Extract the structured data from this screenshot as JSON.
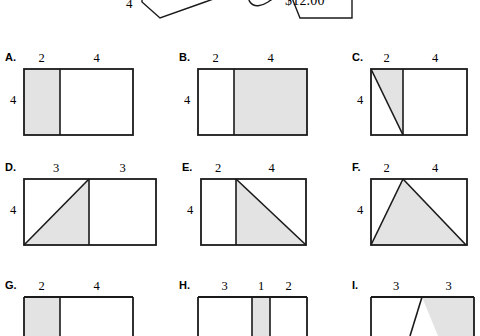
{
  "page": {
    "background_color": "#ffffff",
    "stroke_color": "#1a1a1a",
    "shade_color": "#e3e3e3",
    "width": 480,
    "height": 312
  },
  "top_partial": {
    "price_label": "$12.00",
    "side_label": "4",
    "note": "partially cropped shapes at top edge"
  },
  "items": [
    {
      "key": "A",
      "label": "A.",
      "top_labels": [
        "2",
        "4"
      ],
      "left_label": "4",
      "shaded_region": "left-rectangle",
      "split_fraction": 0.3333
    },
    {
      "key": "B",
      "label": "B.",
      "top_labels": [
        "2",
        "4"
      ],
      "left_label": "4",
      "shaded_region": "right-rectangle",
      "split_fraction": 0.3333
    },
    {
      "key": "C",
      "label": "C.",
      "top_labels": [
        "2",
        "4"
      ],
      "left_label": "4",
      "shaded_region": "left-triangle-upper-right",
      "split_fraction": 0.3333
    },
    {
      "key": "D",
      "label": "D.",
      "top_labels": [
        "3",
        "3"
      ],
      "left_label": "4",
      "shaded_region": "left-triangle-lower-right",
      "split_fraction": 0.5
    },
    {
      "key": "E",
      "label": "E.",
      "top_labels": [
        "2",
        "4"
      ],
      "left_label": "4",
      "shaded_region": "right-triangle-lower-left",
      "split_fraction": 0.3333
    },
    {
      "key": "F",
      "label": "F.",
      "top_labels": [
        "2",
        "4"
      ],
      "left_label": "4",
      "shaded_region": "full-width-triangle-apex-at-split",
      "split_fraction": 0.3333
    },
    {
      "key": "G",
      "label": "G.",
      "top_labels": [
        "2",
        "4"
      ],
      "left_label": "",
      "shaded_region": "cropped",
      "split_fraction": 0.3333
    },
    {
      "key": "H",
      "label": "H.",
      "top_labels": [
        "3",
        "1",
        "2"
      ],
      "left_label": "",
      "shaded_region": "cropped",
      "split_fraction": 0.5
    },
    {
      "key": "I",
      "label": "I.",
      "top_labels": [
        "3",
        "3"
      ],
      "left_label": "",
      "shaded_region": "cropped",
      "split_fraction": 0.5
    }
  ]
}
